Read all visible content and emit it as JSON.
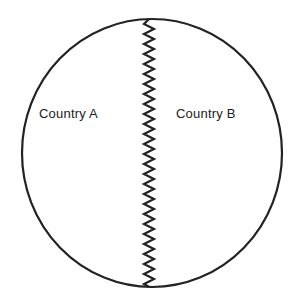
{
  "diagram": {
    "type": "border-diagram",
    "shape": "circle",
    "divider": "zigzag-border",
    "regions": [
      {
        "label": "Country A",
        "side": "left"
      },
      {
        "label": "Country B",
        "side": "right"
      }
    ],
    "colors": {
      "stroke": "#222222",
      "background": "#ffffff",
      "text": "#222222"
    }
  }
}
